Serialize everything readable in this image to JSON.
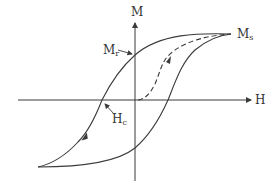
{
  "diagram": {
    "axes": {
      "x_label": "H",
      "y_label": "M"
    },
    "labels": {
      "saturation": {
        "main": "M",
        "sub": "s"
      },
      "remanence": {
        "main": "M",
        "sub": "r"
      },
      "coercivity": {
        "main": "H",
        "sub": "c"
      }
    },
    "curves": [
      {
        "name": "upper-branch",
        "style": "solid"
      },
      {
        "name": "lower-branch",
        "style": "solid"
      },
      {
        "name": "initial-magnetization",
        "style": "dashed"
      }
    ],
    "colors": {
      "line": "#3a3a3a",
      "text": "#333333"
    }
  }
}
